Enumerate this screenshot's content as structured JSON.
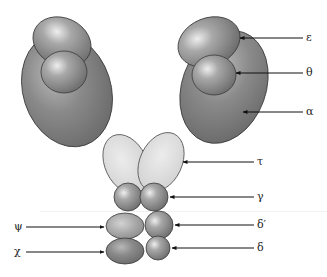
{
  "diagram": {
    "colors": {
      "dark_subunit": "#7a7a7a",
      "light_subunit": "#d8d8d8",
      "medium_subunit": "#9a9a9a",
      "outline": "#3a3a3a",
      "arrow": "#111111"
    },
    "labels": {
      "epsilon": "ε",
      "theta": "θ",
      "alpha": "α",
      "tau": "τ",
      "gamma": "γ",
      "delta_prime": "δ′",
      "delta": "δ",
      "psi": "ψ",
      "chi": "χ"
    }
  }
}
